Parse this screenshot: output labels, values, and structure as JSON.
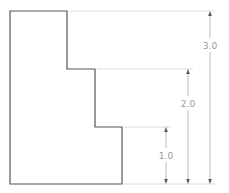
{
  "drawing": {
    "outline_color": "#555555",
    "dimension_color": "#a8a8a8",
    "extension_color": "#d0d0d0",
    "outline_points": [
      [
        10,
        11
      ],
      [
        67,
        11
      ],
      [
        67,
        69
      ],
      [
        95,
        69
      ],
      [
        95,
        127
      ],
      [
        122,
        127
      ],
      [
        122,
        184
      ],
      [
        10,
        184
      ]
    ],
    "dimensions": [
      {
        "label": "1.0",
        "x": 166,
        "y_top": 127,
        "y_bottom": 184,
        "label_y": 156,
        "ext_from": 122
      },
      {
        "label": "2.0",
        "x": 188,
        "y_top": 69,
        "y_bottom": 184,
        "label_y": 104,
        "ext_from": 95
      },
      {
        "label": "3.0",
        "x": 210,
        "y_top": 11,
        "y_bottom": 184,
        "label_y": 46,
        "ext_from": 67
      }
    ],
    "baseline": {
      "y": 184,
      "x_from": 122,
      "x_to": 215
    }
  }
}
